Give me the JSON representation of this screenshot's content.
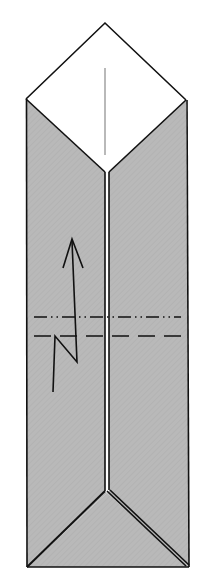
{
  "diagram": {
    "title": "",
    "type": "origami-fold-diagram",
    "colors": {
      "paper_back": "#b9b9b9",
      "paper_front": "#ffffff",
      "line": "#111111",
      "center_crease": "#8a8a8a"
    },
    "shapes": {
      "top_flap": "26,99 105,23 186,100 109,172 105,172",
      "left_panel": "26,99 105,172 105,491 107,493 27,567",
      "right_panel": "186,100 109,172 109,491 107,493 189,567",
      "bottom_triangle": "107,493 27,567 189,567"
    },
    "lines": {
      "center_crease": {
        "x1": 105,
        "y1": 68,
        "x2": 105,
        "y2": 155
      },
      "mountain_fold": {
        "x1": 34,
        "y1": 317,
        "x2": 181,
        "y2": 317,
        "style": "dash-dot-dot"
      },
      "valley_fold": {
        "x1": 34,
        "y1": 336,
        "x2": 185,
        "y2": 336,
        "style": "dashed"
      }
    },
    "arrow": {
      "path": "M53,392 L55,336 L77,362 L72,241",
      "head": "M63,268 L72,239 L83,268",
      "meaning": "pleat-fold-up"
    },
    "labels": []
  }
}
